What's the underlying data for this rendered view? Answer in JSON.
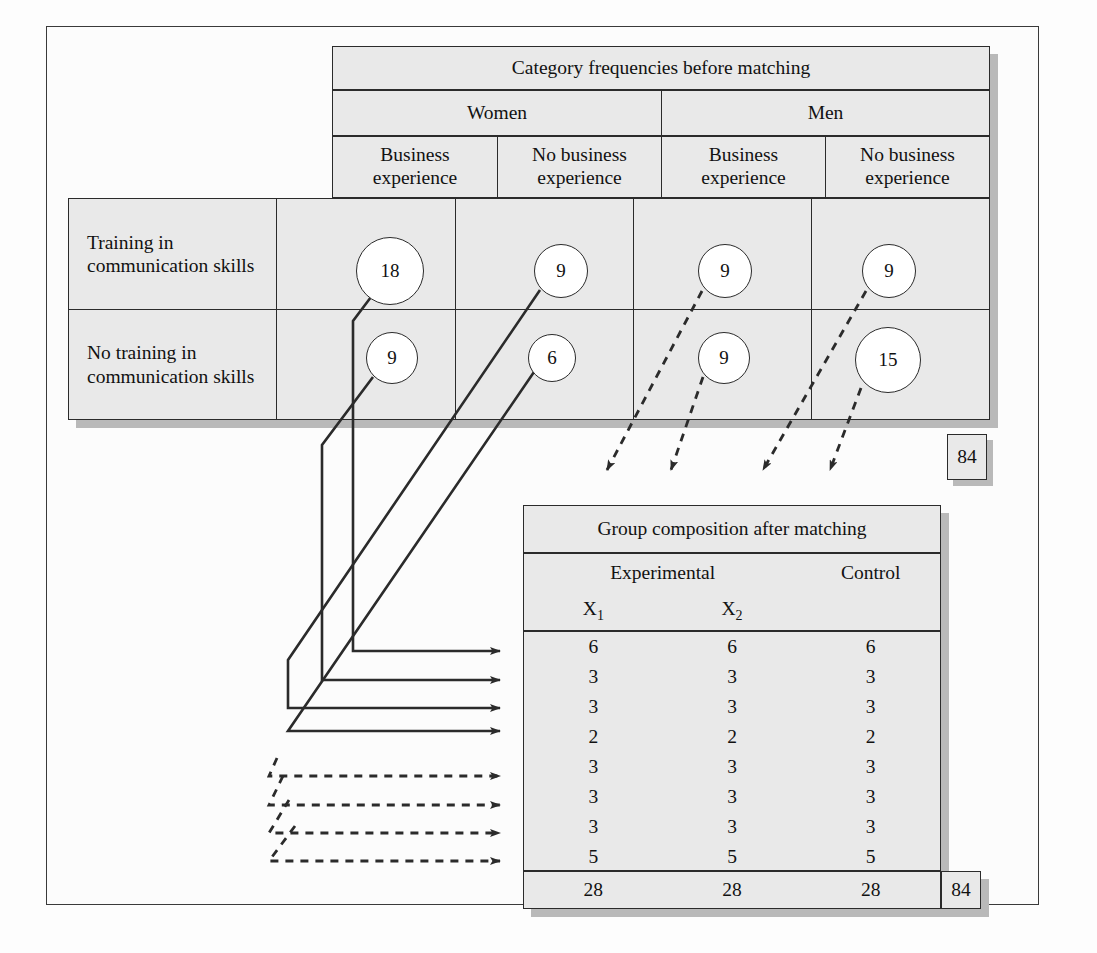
{
  "figure": {
    "top_table": {
      "title": "Category frequencies before matching",
      "gender_headers": [
        "Women",
        "Men"
      ],
      "experience_headers": [
        "Business experience",
        "No business experience",
        "Business experience",
        "No business experience"
      ],
      "row_labels": [
        "Training in communication skills",
        "No training in communication skills"
      ],
      "cells": [
        [
          18,
          9,
          9,
          9
        ],
        [
          9,
          6,
          9,
          15
        ]
      ],
      "grand_total": "84"
    },
    "bottom_table": {
      "title": "Group composition after matching",
      "group_headers": [
        "Experimental",
        "Control"
      ],
      "column_headers": [
        "X1",
        "X2",
        "Control"
      ],
      "subscript_labels": [
        "X",
        "X"
      ],
      "subscripts": [
        "1",
        "2"
      ],
      "rows": [
        [
          6,
          6,
          6
        ],
        [
          3,
          3,
          3
        ],
        [
          3,
          3,
          3
        ],
        [
          2,
          2,
          2
        ],
        [
          3,
          3,
          3
        ],
        [
          3,
          3,
          3
        ],
        [
          3,
          3,
          3
        ],
        [
          5,
          5,
          5
        ]
      ],
      "totals": [
        "28",
        "28",
        "28"
      ],
      "grand_total": "84"
    },
    "colors": {
      "panel_fill": "#e9e9e9",
      "panel_border": "#2b2b2b",
      "shadow": "#b9b9b9",
      "circle_fill": "#ffffff",
      "line": "#2b2b2b",
      "page": "#fcfcfc"
    }
  }
}
